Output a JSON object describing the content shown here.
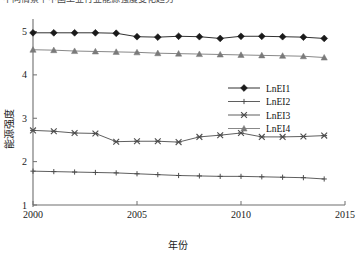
{
  "caption": {
    "text": "不同情景下中国工业行业能源强度变化趋势"
  },
  "chart_data": {
    "type": "line",
    "title": "",
    "xlabel": "年份",
    "ylabel": "能源强度",
    "x": [
      2000,
      2001,
      2002,
      2003,
      2004,
      2005,
      2006,
      2007,
      2008,
      2009,
      2010,
      2011,
      2012,
      2013,
      2014
    ],
    "xlim": [
      2000,
      2015
    ],
    "ylim": [
      1,
      5.15
    ],
    "xticks": [
      2000,
      2005,
      2010,
      2015
    ],
    "xtick_labels": [
      "2000",
      "2005",
      "2010",
      "2015"
    ],
    "yticks": [
      1,
      2,
      3,
      4,
      5
    ],
    "ytick_labels": [
      "1",
      "2",
      "3",
      "4",
      "5"
    ],
    "grid": false,
    "legend_position": "right-middle",
    "series": [
      {
        "name": "LnEI1",
        "marker": "diamond",
        "color": "#1a1a1a",
        "values": [
          4.97,
          4.97,
          4.97,
          4.97,
          4.96,
          4.88,
          4.87,
          4.89,
          4.88,
          4.84,
          4.89,
          4.89,
          4.88,
          4.87,
          4.84
        ]
      },
      {
        "name": "LnEI2",
        "marker": "plus",
        "color": "#4d4d4d",
        "values": [
          1.78,
          1.77,
          1.76,
          1.75,
          1.74,
          1.72,
          1.7,
          1.68,
          1.67,
          1.66,
          1.66,
          1.65,
          1.64,
          1.63,
          1.6
        ]
      },
      {
        "name": "LnEI3",
        "marker": "cross",
        "color": "#4d4d4d",
        "values": [
          2.72,
          2.7,
          2.66,
          2.65,
          2.46,
          2.47,
          2.47,
          2.45,
          2.57,
          2.61,
          2.66,
          2.57,
          2.57,
          2.58,
          2.6
        ]
      },
      {
        "name": "LnEI4",
        "marker": "triangle",
        "color": "#7a7a7a",
        "values": [
          4.58,
          4.57,
          4.55,
          4.54,
          4.53,
          4.52,
          4.5,
          4.49,
          4.48,
          4.47,
          4.46,
          4.45,
          4.44,
          4.43,
          4.4
        ]
      }
    ]
  }
}
